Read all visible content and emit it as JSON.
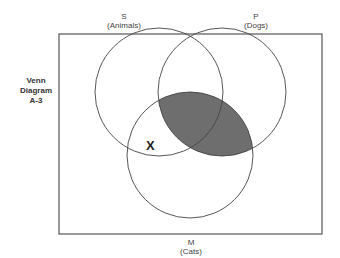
{
  "diagram": {
    "title_lines": [
      "Venn",
      "Diagram",
      "A-3"
    ],
    "sets": {
      "S": {
        "letter": "S",
        "name": "(Animals)"
      },
      "P": {
        "letter": "P",
        "name": "(Dogs)"
      },
      "M": {
        "letter": "M",
        "name": "(Cats)"
      }
    },
    "mark": "X",
    "shaded_region": "P ∩ M",
    "colors": {
      "shade": "#6e6e6e",
      "stroke": "#444444"
    }
  }
}
